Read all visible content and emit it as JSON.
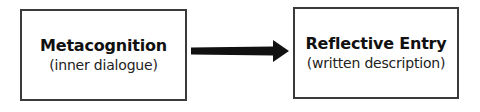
{
  "diagram": {
    "nodes": [
      {
        "id": "metacognition",
        "title": "Metacognition",
        "subtitle": "(inner dialogue)"
      },
      {
        "id": "reflective-entry",
        "title": "Reflective Entry",
        "subtitle": "(written description)"
      }
    ],
    "edges": [
      {
        "from": "metacognition",
        "to": "reflective-entry",
        "style": "thick-arrow"
      }
    ],
    "colors": {
      "border": "#3a3a3a",
      "arrow": "#111111",
      "background": "#ffffff"
    }
  }
}
